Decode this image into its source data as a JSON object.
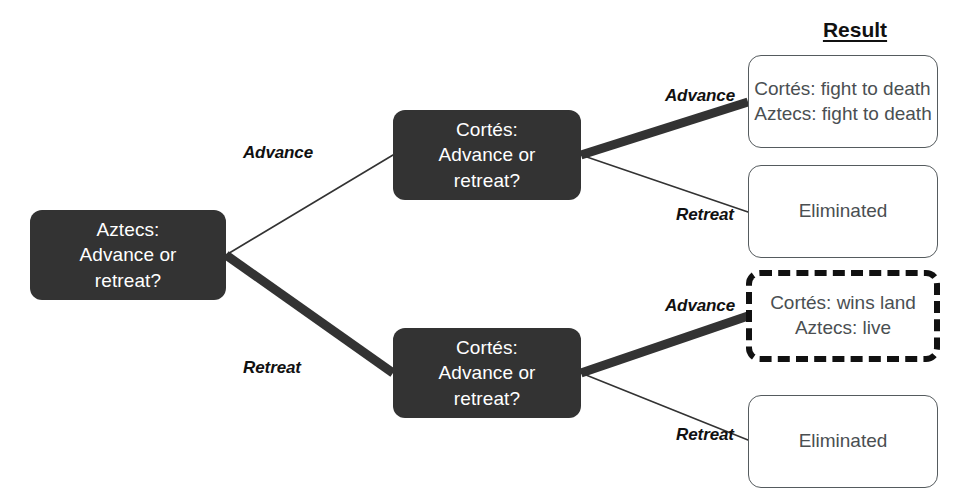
{
  "diagram": {
    "column_header": {
      "label": "Result",
      "x": 855,
      "y": 18
    },
    "colors": {
      "decision_node_fill": "#333333",
      "decision_node_text": "#ffffff",
      "result_node_border": "#555b5e",
      "result_node_text": "#4a4f52",
      "highlight_border": "#111111",
      "edge_color": "#333333",
      "background": "#ffffff"
    },
    "decision_nodes": [
      {
        "id": "aztecs-root",
        "label": "Aztecs:\nAdvance or\nretreat?",
        "x": 30,
        "y": 210,
        "w": 196,
        "h": 90
      },
      {
        "id": "cortes-upper",
        "label": "Cortés:\nAdvance or\nretreat?",
        "x": 393,
        "y": 110,
        "w": 188,
        "h": 90
      },
      {
        "id": "cortes-lower",
        "label": "Cortés:\nAdvance or\nretreat?",
        "x": 393,
        "y": 328,
        "w": 188,
        "h": 90
      }
    ],
    "result_nodes": [
      {
        "id": "result-fight-to-death",
        "label": "Cortés: fight to death\nAztecs: fight to death",
        "align": "left",
        "highlighted": false,
        "x": 748,
        "y": 55,
        "w": 190,
        "h": 93
      },
      {
        "id": "result-eliminated-upper",
        "label": "Eliminated",
        "align": "center",
        "highlighted": false,
        "x": 748,
        "y": 165,
        "w": 190,
        "h": 93
      },
      {
        "id": "result-cortes-wins-land",
        "label": "Cortés: wins land\nAztecs: live",
        "align": "center",
        "highlighted": true,
        "x": 746,
        "y": 270,
        "w": 194,
        "h": 92
      },
      {
        "id": "result-eliminated-lower",
        "label": "Eliminated",
        "align": "center",
        "highlighted": false,
        "x": 748,
        "y": 395,
        "w": 190,
        "h": 93
      }
    ],
    "edges": [
      {
        "id": "edge-root-advance",
        "label": "Advance",
        "from": "aztecs-root",
        "to": "cortes-upper",
        "weight": "thin",
        "x1": 226,
        "y1": 255,
        "x2": 393,
        "y2": 155,
        "label_x": 278,
        "label_y": 153
      },
      {
        "id": "edge-root-retreat",
        "label": "Retreat",
        "from": "aztecs-root",
        "to": "cortes-lower",
        "weight": "thick",
        "x1": 226,
        "y1": 255,
        "x2": 393,
        "y2": 373,
        "label_x": 272,
        "label_y": 368
      },
      {
        "id": "edge-upper-advance",
        "label": "Advance",
        "from": "cortes-upper",
        "to": "result-fight-to-death",
        "weight": "thick",
        "x1": 581,
        "y1": 155,
        "x2": 748,
        "y2": 102,
        "label_x": 700,
        "label_y": 96
      },
      {
        "id": "edge-upper-retreat",
        "label": "Retreat",
        "from": "cortes-upper",
        "to": "result-eliminated-upper",
        "weight": "thin",
        "x1": 581,
        "y1": 155,
        "x2": 748,
        "y2": 212,
        "label_x": 705,
        "label_y": 215
      },
      {
        "id": "edge-lower-advance",
        "label": "Advance",
        "from": "cortes-lower",
        "to": "result-cortes-wins-land",
        "weight": "thick",
        "x1": 581,
        "y1": 373,
        "x2": 748,
        "y2": 316,
        "label_x": 700,
        "label_y": 306
      },
      {
        "id": "edge-lower-retreat",
        "label": "Retreat",
        "from": "cortes-lower",
        "to": "result-eliminated-lower",
        "weight": "thin",
        "x1": 581,
        "y1": 373,
        "x2": 748,
        "y2": 440,
        "label_x": 705,
        "label_y": 435
      }
    ]
  }
}
